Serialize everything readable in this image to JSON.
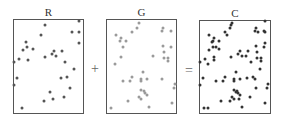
{
  "panels": [
    {
      "id": "R",
      "label": "R",
      "dot_color": "#555555",
      "box": {
        "x": 13,
        "y": 19,
        "w": 71,
        "h": 95
      }
    },
    {
      "id": "G",
      "label": "G",
      "dot_color": "#9a9a9a",
      "box": {
        "x": 106,
        "y": 19,
        "w": 71,
        "h": 95
      }
    },
    {
      "id": "C",
      "label": "C",
      "dot_color": "#333333",
      "box": {
        "x": 199,
        "y": 20,
        "w": 72,
        "h": 94
      }
    }
  ],
  "operators": {
    "plus": "+",
    "equals": "="
  },
  "dots": {
    "R": [
      [
        45,
        25
      ],
      [
        79,
        21
      ],
      [
        41,
        35
      ],
      [
        72,
        32
      ],
      [
        79,
        32
      ],
      [
        79,
        43
      ],
      [
        26,
        42
      ],
      [
        27,
        47
      ],
      [
        23,
        50
      ],
      [
        33,
        49
      ],
      [
        19,
        59
      ],
      [
        28,
        60
      ],
      [
        14,
        62
      ],
      [
        45,
        57
      ],
      [
        52,
        54
      ],
      [
        54,
        51
      ],
      [
        56,
        56
      ],
      [
        62,
        51
      ],
      [
        65,
        62
      ],
      [
        74,
        69
      ],
      [
        17,
        78
      ],
      [
        14,
        85
      ],
      [
        61,
        78
      ],
      [
        67,
        77
      ],
      [
        70,
        88
      ],
      [
        50,
        92
      ],
      [
        64,
        97
      ],
      [
        44,
        101
      ],
      [
        53,
        99
      ],
      [
        22,
        108
      ]
    ],
    "G": [
      [
        139,
        23
      ],
      [
        137,
        28
      ],
      [
        132,
        32
      ],
      [
        116,
        35
      ],
      [
        121,
        38
      ],
      [
        120,
        41
      ],
      [
        126,
        41
      ],
      [
        123,
        47
      ],
      [
        163,
        28
      ],
      [
        162,
        31
      ],
      [
        171,
        31
      ],
      [
        163,
        46
      ],
      [
        171,
        47
      ],
      [
        164,
        52
      ],
      [
        153,
        56
      ],
      [
        121,
        57
      ],
      [
        164,
        58
      ],
      [
        168,
        58
      ],
      [
        168,
        61
      ],
      [
        115,
        64
      ],
      [
        143,
        72
      ],
      [
        132,
        77
      ],
      [
        130,
        81
      ],
      [
        123,
        81
      ],
      [
        141,
        79
      ],
      [
        141,
        81
      ],
      [
        147,
        79
      ],
      [
        162,
        79
      ],
      [
        175,
        84
      ],
      [
        174,
        88
      ],
      [
        141,
        90
      ],
      [
        144,
        91
      ],
      [
        145,
        93
      ],
      [
        147,
        95
      ],
      [
        139,
        97
      ],
      [
        141,
        99
      ],
      [
        128,
        101
      ],
      [
        172,
        103
      ],
      [
        149,
        107
      ],
      [
        111,
        108
      ]
    ]
  }
}
